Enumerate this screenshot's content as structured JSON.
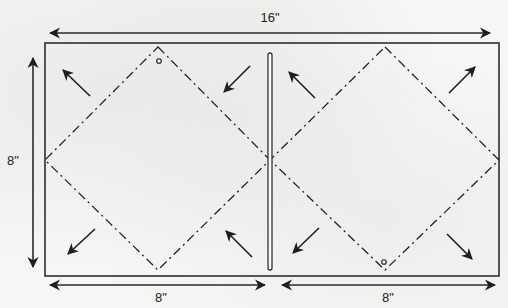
{
  "diagram": {
    "colors": {
      "stroke": "#2a2a2a",
      "background": "#f6f6f5"
    },
    "dimensions": {
      "width_label": "16\"",
      "height_label": "8\"",
      "left_half_label": "8\"",
      "right_half_label": "8\""
    },
    "sheet": {
      "x": 45,
      "y": 43,
      "width": 454,
      "height": 233
    },
    "center_slot": {
      "x": 270,
      "y_top": 53,
      "y_bottom": 270
    },
    "diamonds": [
      {
        "name": "left-diamond",
        "points": [
          [
            158,
            47
          ],
          [
            270,
            160
          ],
          [
            158,
            270
          ],
          [
            45,
            160
          ]
        ],
        "marker_circle": [
          159,
          61
        ]
      },
      {
        "name": "right-diamond",
        "points": [
          [
            385,
            47
          ],
          [
            499,
            160
          ],
          [
            385,
            270
          ],
          [
            270,
            160
          ]
        ],
        "marker_circle": [
          384,
          262
        ]
      }
    ],
    "fold_arrows": [
      {
        "name": "arrow-left-top-left",
        "from": [
          90,
          96
        ],
        "to": [
          63,
          70
        ],
        "direction": "up-left"
      },
      {
        "name": "arrow-left-top-right",
        "from": [
          250,
          66
        ],
        "to": [
          224,
          92
        ],
        "direction": "down-left"
      },
      {
        "name": "arrow-left-bottom-left",
        "from": [
          95,
          229
        ],
        "to": [
          68,
          254
        ],
        "direction": "down-left"
      },
      {
        "name": "arrow-left-bottom-right",
        "from": [
          252,
          257
        ],
        "to": [
          226,
          231
        ],
        "direction": "up-left"
      },
      {
        "name": "arrow-right-top-left",
        "from": [
          315,
          98
        ],
        "to": [
          289,
          72
        ],
        "direction": "up-left"
      },
      {
        "name": "arrow-right-top-right",
        "from": [
          449,
          93
        ],
        "to": [
          475,
          67
        ],
        "direction": "up-right"
      },
      {
        "name": "arrow-right-bottom-left",
        "from": [
          319,
          228
        ],
        "to": [
          293,
          253
        ],
        "direction": "down-left"
      },
      {
        "name": "arrow-right-bottom-right",
        "from": [
          447,
          234
        ],
        "to": [
          472,
          259
        ],
        "direction": "down-right"
      }
    ],
    "dimension_arrows": [
      {
        "name": "width-arrow-16in",
        "from": [
          50,
          33
        ],
        "to": [
          490,
          33
        ],
        "double": true
      },
      {
        "name": "height-arrow-8in",
        "from": [
          33,
          58
        ],
        "to": [
          33,
          267
        ],
        "double": true
      },
      {
        "name": "left-half-arrow-8in",
        "from": [
          50,
          285
        ],
        "to": [
          265,
          285
        ],
        "double": true
      },
      {
        "name": "right-half-arrow-8in",
        "from": [
          282,
          285
        ],
        "to": [
          495,
          285
        ],
        "double": true
      }
    ]
  }
}
